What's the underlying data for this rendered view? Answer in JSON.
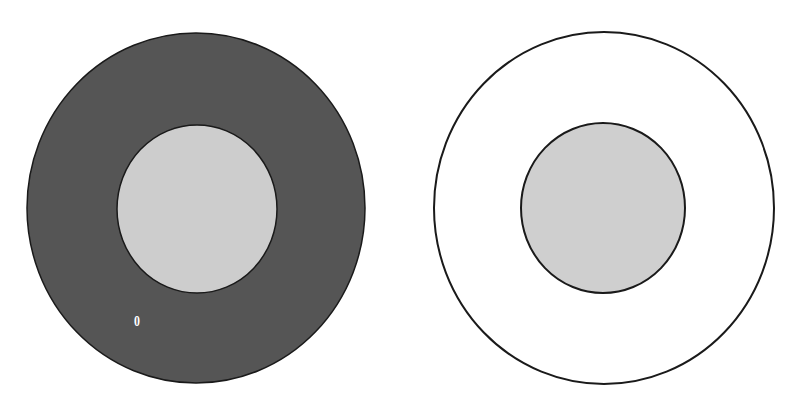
{
  "diagram": {
    "figures": [
      {
        "id": "left",
        "outer": {
          "cx": 196,
          "cy": 208,
          "rx": 169,
          "ry": 175,
          "fill": "#555555",
          "stroke": "#1a1a1a"
        },
        "inner": {
          "cx": 197,
          "cy": 209,
          "rx": 80,
          "ry": 84,
          "fill": "#cdcdcd",
          "stroke": "#1a1a1a"
        },
        "label": {
          "text": "0",
          "x": 137,
          "y": 322,
          "color": "#ffffff"
        }
      },
      {
        "id": "right",
        "outer": {
          "cx": 604,
          "cy": 208,
          "rx": 170,
          "ry": 176,
          "fill": "#ffffff",
          "stroke": "#1a1a1a"
        },
        "inner": {
          "cx": 603,
          "cy": 208,
          "rx": 82,
          "ry": 85,
          "fill": "#cfcfcf",
          "stroke": "#1a1a1a"
        }
      }
    ],
    "colors": {
      "background": "#ffffff",
      "dark_ring": "#555555",
      "inner_fill": "#cdcdcd",
      "outline": "#1a1a1a"
    }
  }
}
